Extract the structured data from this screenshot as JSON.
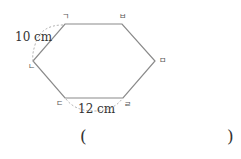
{
  "figure": {
    "shape": "hexagon",
    "vertices": [
      {
        "name": "ㄱ",
        "x": 65,
        "y": 24
      },
      {
        "name": "ㅂ",
        "x": 122,
        "y": 24
      },
      {
        "name": "ㅁ",
        "x": 155,
        "y": 61
      },
      {
        "name": "ㄹ",
        "x": 123,
        "y": 98
      },
      {
        "name": "ㄷ",
        "x": 65,
        "y": 98
      },
      {
        "name": "ㄴ",
        "x": 33,
        "y": 61
      }
    ],
    "side_labels": {
      "giyeok_nieun": "10 cm",
      "digeut_rieul": "12 cm"
    },
    "colors": {
      "edge": "#888888",
      "dashed": "#999999"
    }
  },
  "answer": {
    "open_paren": "(",
    "close_paren": ")"
  }
}
